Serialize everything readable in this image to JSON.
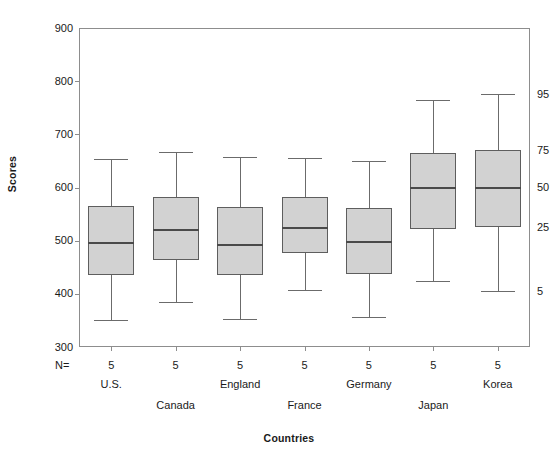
{
  "chart_data": {
    "type": "box",
    "title": "",
    "xlabel": "Countries",
    "ylabel": "Scores",
    "ylim": [
      300,
      900
    ],
    "yticks": [
      300,
      400,
      500,
      600,
      700,
      800,
      900
    ],
    "grid": false,
    "legend": "none",
    "n_label": "N=",
    "percentile_annotations": [
      {
        "label": "95",
        "value": 775
      },
      {
        "label": "75",
        "value": 670
      },
      {
        "label": "50",
        "value": 600
      },
      {
        "label": "25",
        "value": 525
      },
      {
        "label": "5",
        "value": 405
      }
    ],
    "categories": [
      "U.S.",
      "Canada",
      "England",
      "France",
      "Germany",
      "Japan",
      "Korea"
    ],
    "counts": [
      5,
      5,
      5,
      5,
      5,
      5,
      5
    ],
    "boxes": [
      {
        "category": "U.S.",
        "n": 5,
        "whisker_low": 350,
        "q1": 435,
        "median": 495,
        "q3": 565,
        "whisker_high": 653
      },
      {
        "category": "Canada",
        "n": 5,
        "whisker_low": 385,
        "q1": 463,
        "median": 521,
        "q3": 582,
        "whisker_high": 666
      },
      {
        "category": "England",
        "n": 5,
        "whisker_low": 353,
        "q1": 435,
        "median": 492,
        "q3": 563,
        "whisker_high": 657
      },
      {
        "category": "France",
        "n": 5,
        "whisker_low": 408,
        "q1": 476,
        "median": 523,
        "q3": 582,
        "whisker_high": 655
      },
      {
        "category": "Germany",
        "n": 5,
        "whisker_low": 356,
        "q1": 437,
        "median": 497,
        "q3": 562,
        "whisker_high": 650
      },
      {
        "category": "Japan",
        "n": 5,
        "whisker_low": 425,
        "q1": 522,
        "median": 600,
        "q3": 664,
        "whisker_high": 765
      },
      {
        "category": "Korea",
        "n": 5,
        "whisker_low": 405,
        "q1": 525,
        "median": 600,
        "q3": 670,
        "whisker_high": 775
      }
    ],
    "colors": {
      "box_fill": "#d2d2d2",
      "box_border": "#5e5e5e",
      "median": "#4a4a4a",
      "whisker": "#6b6b6b",
      "axis": "#8d8d8d",
      "text": "#1a1a1a",
      "background": "#ffffff"
    }
  }
}
